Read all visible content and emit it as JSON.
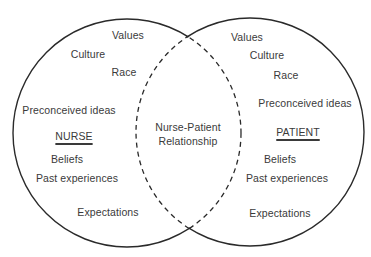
{
  "diagram": {
    "type": "venn",
    "colors": {
      "stroke": "#2a2a2a",
      "text": "#3a3a3a",
      "background": "#ffffff"
    },
    "left_circle": {
      "title": "NURSE",
      "items": {
        "values": "Values",
        "culture": "Culture",
        "race": "Race",
        "preconceived": "Preconceived ideas",
        "beliefs": "Beliefs",
        "past": "Past experiences",
        "expectations": "Expectations"
      }
    },
    "right_circle": {
      "title": "PATIENT",
      "items": {
        "values": "Values",
        "culture": "Culture",
        "race": "Race",
        "preconceived": "Preconceived ideas",
        "beliefs": "Beliefs",
        "past": "Past experiences",
        "expectations": "Expectations"
      }
    },
    "intersection": {
      "line1": "Nurse-Patient",
      "line2": "Relationship"
    }
  }
}
